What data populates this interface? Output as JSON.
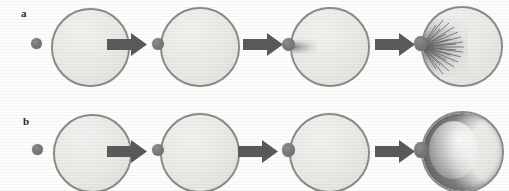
{
  "figure": {
    "background_color": "#fdfdfc",
    "width": 509,
    "height": 191
  },
  "style": {
    "droplet_fill": "#e9e9e6",
    "droplet_stroke": "#8b8b8b",
    "particle_color": "#787878",
    "arrow_color": "#5a5a5a",
    "plume_color": "#5f5f5f",
    "label_color": "#2b2b2b"
  },
  "rows": [
    {
      "id": "a",
      "label": "a",
      "frames": [
        {
          "caption": "approach",
          "particle_state": "free",
          "droplet_state": "intact"
        },
        {
          "caption": "contact",
          "particle_state": "touching",
          "droplet_state": "intact"
        },
        {
          "caption": "penetration",
          "particle_state": "attached",
          "droplet_state": "small-plume"
        },
        {
          "caption": "dispersion",
          "particle_state": "attached",
          "droplet_state": "radial-burst"
        }
      ]
    },
    {
      "id": "b",
      "label": "b",
      "frames": [
        {
          "caption": "approach",
          "particle_state": "free",
          "droplet_state": "intact"
        },
        {
          "caption": "contact",
          "particle_state": "touching",
          "droplet_state": "intact"
        },
        {
          "caption": "adhesion",
          "particle_state": "squashed",
          "droplet_state": "intact"
        },
        {
          "caption": "encapsulation",
          "particle_state": "squashed",
          "droplet_state": "crescent-shell"
        }
      ]
    }
  ],
  "arrows": {
    "glyph": "block-arrow-right",
    "count_per_row": 3,
    "direction": "right"
  }
}
